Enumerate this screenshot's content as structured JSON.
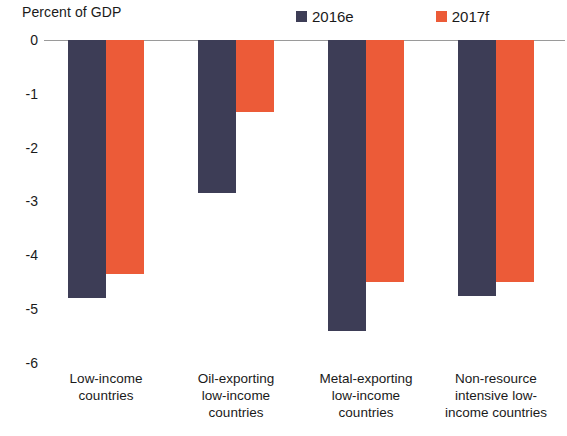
{
  "chart_data": {
    "type": "bar",
    "title": "",
    "ylabel": "Percent of GDP",
    "xlabel": "",
    "ylim": [
      -6,
      0
    ],
    "yticks": [
      0,
      -1,
      -2,
      -3,
      -4,
      -5,
      -6
    ],
    "ytick_labels": [
      "0",
      "-1",
      "-2",
      "-3",
      "-4",
      "-5",
      "-6"
    ],
    "grid": false,
    "legend_position": "top-center",
    "categories": [
      "Low-income countries",
      "Oil-exporting low-income countries",
      "Metal-exporting low-income countries",
      "Non-resource intensive low-income countries"
    ],
    "category_lines": [
      [
        "Low-income",
        "countries"
      ],
      [
        "Oil-exporting",
        "low-income",
        "countries"
      ],
      [
        "Metal-exporting",
        "low-income",
        "countries"
      ],
      [
        "Non-resource",
        "intensive low-",
        "income countries"
      ]
    ],
    "series": [
      {
        "name": "2016e",
        "color": "#3d3d56",
        "values": [
          -4.8,
          -2.85,
          -5.4,
          -4.75
        ]
      },
      {
        "name": "2017f",
        "color": "#ec5b38",
        "values": [
          -4.35,
          -1.33,
          -4.5,
          -4.5
        ]
      }
    ]
  },
  "legend": {
    "items": [
      {
        "label": "2016e",
        "color": "#3d3d56"
      },
      {
        "label": "2017f",
        "color": "#ec5b38"
      }
    ]
  },
  "axis": {
    "y_title": "Percent of GDP",
    "ticks": [
      "0",
      "-1",
      "-2",
      "-3",
      "-4",
      "-5",
      "-6"
    ]
  }
}
